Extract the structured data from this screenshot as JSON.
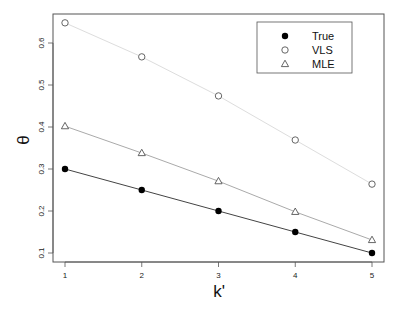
{
  "chart_data": {
    "type": "line",
    "title": "",
    "xlabel": "k'",
    "ylabel": "θ",
    "x": [
      1,
      2,
      3,
      4,
      5
    ],
    "xticks": [
      "1",
      "2",
      "3",
      "4",
      "5"
    ],
    "yticks": [
      "0.1",
      "0.2",
      "0.3",
      "0.4",
      "0.5",
      "0.6"
    ],
    "xlim": [
      0.85,
      5.15
    ],
    "ylim": [
      0.078,
      0.67
    ],
    "grid": false,
    "legend_position": "top-right",
    "series": [
      {
        "name": "True",
        "marker": "filled-circle",
        "color": "#000000",
        "line_color": "#444444",
        "values": [
          0.3,
          0.25,
          0.2,
          0.15,
          0.1
        ]
      },
      {
        "name": "VLS",
        "marker": "open-circle",
        "color": "#555555",
        "line_color": "#dddddd",
        "values": [
          0.648,
          0.567,
          0.474,
          0.369,
          0.264
        ]
      },
      {
        "name": "MLE",
        "marker": "open-triangle",
        "color": "#555555",
        "line_color": "#aaaaaa",
        "values": [
          0.402,
          0.338,
          0.271,
          0.198,
          0.131
        ]
      }
    ]
  }
}
